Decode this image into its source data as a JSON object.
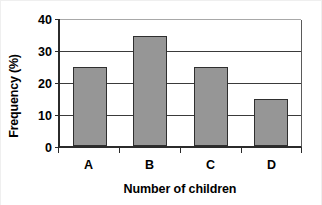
{
  "chart_data": {
    "type": "bar",
    "title": "",
    "subtitle": "",
    "categories": [
      "A",
      "B",
      "C",
      "D"
    ],
    "values": [
      25,
      35,
      25,
      15
    ],
    "series": [
      {
        "name": "Frequency",
        "values": [
          25,
          35,
          25,
          15
        ]
      }
    ],
    "xlabel": "Number of children",
    "ylabel": "Frequency (%)",
    "ylim": [
      0,
      40
    ],
    "yticks": [
      0,
      10,
      20,
      30,
      40
    ],
    "ytick_labels": [
      "0",
      "10",
      "20",
      "30",
      "40"
    ],
    "grid": true,
    "grid_axis": "y",
    "legend": false,
    "legend_position": "none",
    "bar_fill_color": "#969696",
    "bar_edge_color": "#2f2f2f",
    "grid_color": "#3a3a3a",
    "top_grid_color": "#a8a8a8",
    "axis_color": "#2b2b2b",
    "background_color": "#ffffff",
    "annotations": []
  }
}
